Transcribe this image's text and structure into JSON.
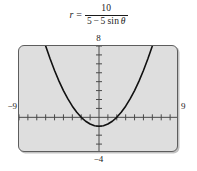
{
  "equation": {
    "variable": "r",
    "equals": "=",
    "numerator": "10",
    "denominator_a": "5",
    "denominator_op": "−",
    "denominator_b": "5",
    "denominator_fn": "sin",
    "denominator_theta": "θ",
    "plain": "r = 10 / (5 − 5 sin θ)"
  },
  "axis_labels": {
    "top": "8",
    "bottom": "−4",
    "left": "−9",
    "right": "9"
  },
  "colors": {
    "plot_background": "#dedede",
    "frame_border": "#5d5d5d",
    "axis": "#4a4a4a",
    "curve": "#111111",
    "page_background": "#ffffff"
  },
  "chart_data": {
    "type": "line",
    "title": "",
    "subtitle": "",
    "xlabel": "",
    "ylabel": "",
    "equation": "r = 10 / (5 − 5 sin θ)",
    "cartesian_form": "y = x^2/4 − 1",
    "grid": false,
    "legend": null,
    "xlim": [
      -9,
      9
    ],
    "ylim": [
      -4,
      8
    ],
    "xtick_step": 1,
    "ytick_step": 1,
    "tick_labels_shown": false,
    "axis_end_labels": {
      "xmin": "−9",
      "xmax": "9",
      "ymin": "−4",
      "ymax": "8"
    },
    "series": [
      {
        "name": "r = 10/(5 − 5 sin θ)",
        "color": "#111111",
        "x": [
          -6.0,
          -5.5,
          -5.0,
          -4.5,
          -4.0,
          -3.5,
          -3.0,
          -2.5,
          -2.0,
          -1.5,
          -1.0,
          -0.5,
          0.0,
          0.5,
          1.0,
          1.5,
          2.0,
          2.5,
          3.0,
          3.5,
          4.0,
          4.5,
          5.0,
          5.5,
          6.0
        ],
        "y": [
          8.0,
          6.5625,
          5.25,
          4.0625,
          3.0,
          2.0625,
          1.25,
          0.5625,
          0.0,
          -0.4375,
          -0.75,
          -0.9375,
          -1.0,
          -0.9375,
          -0.75,
          -0.4375,
          0.0,
          0.5625,
          1.25,
          2.0625,
          3.0,
          4.0625,
          5.25,
          6.5625,
          8.0
        ]
      }
    ],
    "annotations": [
      {
        "text": "vertex",
        "x": 0,
        "y": -1
      },
      {
        "text": "x-intercepts",
        "x": [
          -2,
          2
        ],
        "y": 0
      }
    ]
  }
}
